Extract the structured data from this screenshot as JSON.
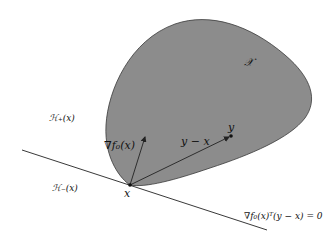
{
  "diagram": {
    "type": "convex-optimality-illustration",
    "colors": {
      "set_fill": "#8c8c8c",
      "set_stroke": "#3a3a3a",
      "line": "#222222",
      "background": "#ffffff"
    },
    "labels": {
      "set": "𝒳",
      "h_plus": "ℋ₊(x)",
      "h_minus": "ℋ₋(x)",
      "point_x": "x",
      "point_y": "y",
      "gradient": "∇f₀(x)",
      "direction": "y − x",
      "hyperplane": "∇f₀(x)ᵀ(y − x) = 0"
    }
  }
}
